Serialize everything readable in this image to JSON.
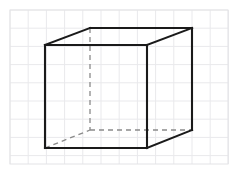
{
  "figure": {
    "width": 239,
    "height": 174,
    "background_color": "#ffffff"
  },
  "grid": {
    "name": "graph-paper-grid",
    "line_color": "#e9e9ec",
    "border_color": "#e3e3e6",
    "line_width": 1,
    "cell_size": 18.2,
    "origin_x": 10,
    "origin_y": 10,
    "columns": 12,
    "rows": 8.5,
    "extent_x": 228,
    "extent_y": 164
  },
  "cube": {
    "name": "wireframe-cube",
    "stroke_color": "#1a1a1a",
    "hidden_stroke_color": "#8a8a8a",
    "stroke_width": 2.1,
    "hidden_stroke_width": 1.3,
    "hidden_dash_pattern": "5 4",
    "projection": "oblique",
    "depth_offset_x": 45,
    "depth_offset_y": -17,
    "vertices": {
      "front_top_left": [
        45,
        45
      ],
      "front_top_right": [
        147,
        45
      ],
      "front_bottom_right": [
        147,
        148
      ],
      "front_bottom_left": [
        45,
        148
      ],
      "back_top_left": [
        90,
        28
      ],
      "back_top_right": [
        192,
        28
      ],
      "back_bottom_right": [
        192,
        130
      ],
      "back_bottom_left": [
        90,
        130
      ]
    },
    "visible_edges": [
      {
        "name": "front-top-edge",
        "from": [
          45,
          45
        ],
        "to": [
          147,
          45
        ]
      },
      {
        "name": "front-right-edge",
        "from": [
          147,
          45
        ],
        "to": [
          147,
          148
        ]
      },
      {
        "name": "front-bottom-edge",
        "from": [
          147,
          148
        ],
        "to": [
          45,
          148
        ]
      },
      {
        "name": "front-left-edge",
        "from": [
          45,
          148
        ],
        "to": [
          45,
          45
        ]
      },
      {
        "name": "back-top-edge",
        "from": [
          90,
          28
        ],
        "to": [
          192,
          28
        ]
      },
      {
        "name": "top-left-receding-edge",
        "from": [
          45,
          45
        ],
        "to": [
          90,
          28
        ]
      },
      {
        "name": "top-right-receding-edge",
        "from": [
          147,
          45
        ],
        "to": [
          192,
          28
        ]
      },
      {
        "name": "back-right-vertical-edge",
        "from": [
          192,
          28
        ],
        "to": [
          192,
          130
        ]
      },
      {
        "name": "bottom-right-receding-edge",
        "from": [
          147,
          148
        ],
        "to": [
          192,
          130
        ]
      }
    ],
    "hidden_edges": [
      {
        "name": "back-left-vertical-edge",
        "from": [
          90,
          28
        ],
        "to": [
          90,
          130
        ]
      },
      {
        "name": "back-bottom-edge",
        "from": [
          90,
          130
        ],
        "to": [
          192,
          130
        ]
      },
      {
        "name": "bottom-left-receding-edge",
        "from": [
          45,
          148
        ],
        "to": [
          90,
          130
        ]
      }
    ]
  }
}
